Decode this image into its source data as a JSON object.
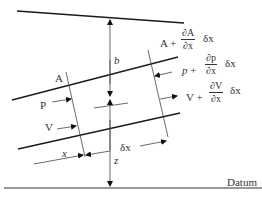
{
  "diagram": {
    "type": "open-channel flow element",
    "labels": {
      "A": "A",
      "P": "P",
      "V": "V",
      "x": "x",
      "z": "z",
      "b": "b",
      "dx": "δx",
      "datum": "Datum"
    },
    "right_terms": {
      "area": {
        "base": "A",
        "plus": "+",
        "num": "∂A",
        "den": "∂x",
        "tail": "δx"
      },
      "pressure": {
        "base": "p",
        "plus": "+",
        "num": "∂p",
        "den": "∂x",
        "tail": "δx"
      },
      "velocity": {
        "base": "V",
        "plus": "+",
        "num": "∂V",
        "den": "∂x",
        "tail": "δx"
      }
    },
    "colors": {
      "line": "#1a1a1a",
      "thin": "#444444",
      "text": "#333333"
    }
  }
}
